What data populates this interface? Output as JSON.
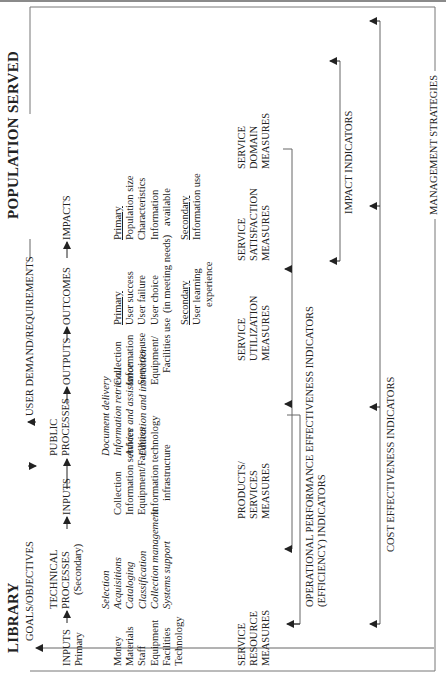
{
  "diagram": {
    "left_header": "LIBRARY",
    "right_header": "POPULATION SERVED",
    "goals_label": "GOALS/OBJECTIVES",
    "demand_label": "USER DEMAND/REQUIREMENTS",
    "management_label": "MANAGEMENT STRATEGIES",
    "flow": [
      {
        "id": "inputs_primary",
        "title": "INPUTS",
        "subtitle": "Primary"
      },
      {
        "id": "technical",
        "title_1": "TECHNICAL",
        "title_2": "PROCESSES",
        "subtitle": "(Secondary)"
      },
      {
        "id": "inputs",
        "title": "INPUTS"
      },
      {
        "id": "public",
        "title_1": "PUBLIC",
        "title_2": "PROCESSES"
      },
      {
        "id": "outputs",
        "title": "OUTPUTS"
      },
      {
        "id": "outcomes",
        "title": "OUTCOMES"
      },
      {
        "id": "impacts",
        "title": "IMPACTS"
      }
    ],
    "lists": {
      "primary_inputs": [
        "Money",
        "Materials",
        "Staff",
        "Equipment",
        "Facilities",
        "Technology"
      ],
      "technical_processes": [
        "Selection",
        "Acquisitions",
        "Cataloging",
        "Classification",
        "Collection management",
        "Systems support"
      ],
      "inputs": [
        "Collection",
        "Information services",
        "Equipment/Facilities",
        "Information technology",
        "infrastructure"
      ],
      "public_processes": [
        "Document delivery",
        "Information retrieval",
        "Advice and assistance",
        "Education and instruction"
      ],
      "outputs": [
        "Collection",
        "Information",
        "Services use",
        "Equipment/",
        "Facilities use"
      ],
      "outcomes_primary_heading": "Primary",
      "outcomes_primary": [
        "User success",
        "User failure",
        "User choice",
        "(in meeting needs)"
      ],
      "outcomes_secondary_heading": "Secondary",
      "outcomes_secondary": [
        "User learning",
        "experience"
      ],
      "impacts_primary_heading": "Primary",
      "impacts_primary": [
        "Population size",
        "Characteristics",
        "Information",
        "available"
      ],
      "impacts_secondary_heading": "Secondary",
      "impacts_secondary": [
        "Information use"
      ]
    },
    "measures": [
      {
        "id": "resource",
        "lines": [
          "SERVICE",
          "RESOURCE",
          "MEASURES"
        ]
      },
      {
        "id": "products",
        "lines": [
          "PRODUCTS/",
          "SERVICES",
          "MEASURES"
        ]
      },
      {
        "id": "utilization",
        "lines": [
          "SERVICE",
          "UTILIZATION",
          "MEASURES"
        ]
      },
      {
        "id": "satisfaction",
        "lines": [
          "SERVICE",
          "SATISFACTION",
          "MEASURES"
        ]
      },
      {
        "id": "domain",
        "lines": [
          "SERVICE",
          "DOMAIN",
          "MEASURES"
        ]
      }
    ],
    "indicators": {
      "operational_1": "OPERATIONAL PERFORMANCE",
      "operational_2": "(EFFICIENCY) INDICATORS",
      "effectiveness": "EFFECTIVENESS INDICATORS",
      "impact": "IMPACT INDICATORS",
      "cost_effectiveness": "COST EFFECTIVENESS INDICATORS"
    }
  }
}
